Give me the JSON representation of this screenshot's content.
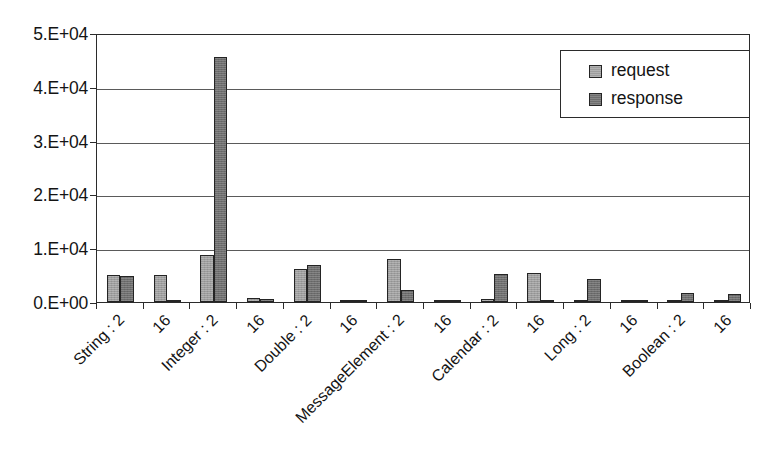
{
  "chart_data": {
    "type": "bar",
    "title": "",
    "subtitle": "",
    "xlabel": "",
    "ylabel": "",
    "ylim": [
      0,
      50000
    ],
    "grid": true,
    "legend_position": "top-right",
    "y_ticks": [
      {
        "value": 50000,
        "label": "5.E+04"
      },
      {
        "value": 40000,
        "label": "4.E+04"
      },
      {
        "value": 30000,
        "label": "3.E+04"
      },
      {
        "value": 20000,
        "label": "2.E+04"
      },
      {
        "value": 10000,
        "label": "1.E+04"
      },
      {
        "value": 0,
        "label": "0.E+00"
      }
    ],
    "categories": [
      "String : 2",
      "16",
      "Integer : 2",
      "16",
      "Double : 2",
      "16",
      "MessageElement : 2",
      "16",
      "Calendar : 2",
      "16",
      "Long : 2",
      "16",
      "Boolean : 2",
      "16"
    ],
    "series": [
      {
        "name": "request",
        "color": "#9d9d9d",
        "values": [
          5000,
          5000,
          8800,
          700,
          6200,
          350,
          8000,
          400,
          600,
          5400,
          250,
          300,
          200,
          250
        ]
      },
      {
        "name": "response",
        "color": "#6d6d6d",
        "values": [
          4900,
          200,
          45500,
          500,
          6800,
          250,
          2200,
          200,
          5200,
          250,
          4200,
          200,
          1700,
          1400
        ]
      }
    ]
  },
  "legend": {
    "entries": [
      {
        "label": "request",
        "color": "#9d9d9d"
      },
      {
        "label": "response",
        "color": "#6d6d6d"
      }
    ]
  },
  "colors": {
    "axis": "#2b2b2b",
    "gridline": "#5a5a5a",
    "text": "#141414",
    "background": "#ffffff",
    "request": "#9d9d9d",
    "response": "#6d6d6d"
  }
}
